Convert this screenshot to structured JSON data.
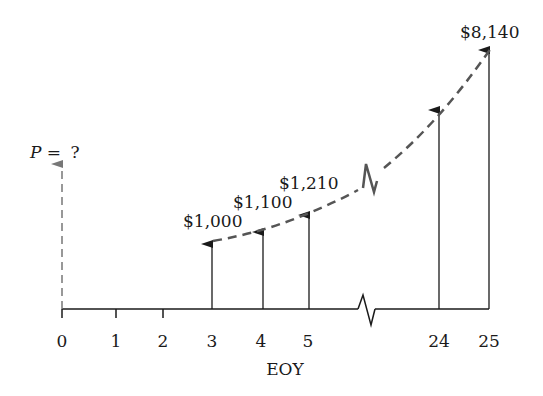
{
  "diagram": {
    "type": "cash-flow-diagram",
    "present_value_label": {
      "var": "P",
      "eq": " = ",
      "value": "?"
    },
    "axis_label": "EOY",
    "ticks": [
      "0",
      "1",
      "2",
      "3",
      "4",
      "5",
      "24",
      "25"
    ],
    "cash_flows": [
      {
        "period": "3",
        "amount": "$1,000"
      },
      {
        "period": "4",
        "amount": "$1,100"
      },
      {
        "period": "5",
        "amount": "$1,210"
      },
      {
        "period": "24",
        "amount": ""
      },
      {
        "period": "25",
        "amount": "$8,140"
      }
    ],
    "colors": {
      "line": "#1a1a1a",
      "dashed": "#555555",
      "p_arrow": "#777777"
    }
  }
}
